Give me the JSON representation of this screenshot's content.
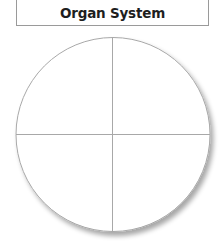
{
  "header": {
    "title": "Organ System"
  },
  "diagram": {
    "type": "quartered-circle",
    "sections": 4,
    "section_labels": [
      "",
      "",
      "",
      ""
    ],
    "line_color": "#a8a8a8",
    "fill_color": "#ffffff"
  }
}
